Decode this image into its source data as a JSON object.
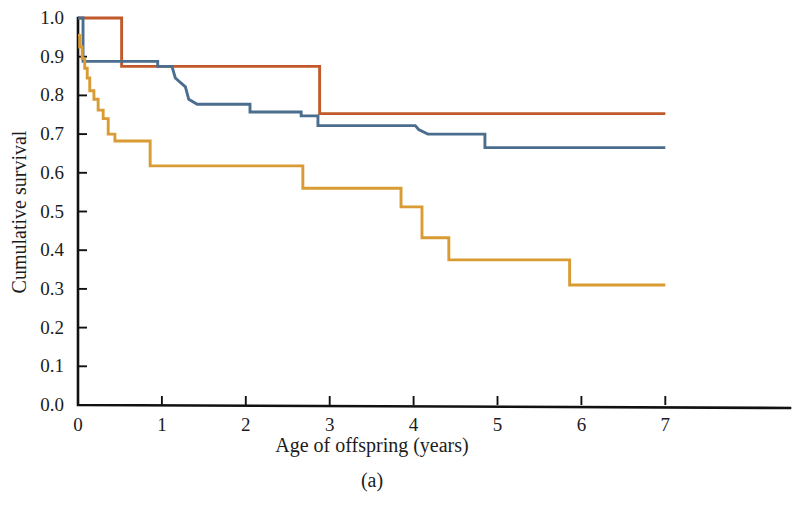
{
  "figure": {
    "panel_label": "(a)",
    "background": "#ffffff"
  },
  "chart_data": {
    "type": "line",
    "title": "",
    "subtitle": "",
    "xlabel": "Age of offspring (years)",
    "ylabel": "Cumulative survival",
    "xlim": [
      0,
      8.5
    ],
    "ylim": [
      0.0,
      1.0
    ],
    "xticks": [
      0,
      1,
      2,
      3,
      4,
      5,
      6,
      7
    ],
    "xtick_labels": [
      "0",
      "1",
      "2",
      "3",
      "4",
      "5",
      "6",
      "7"
    ],
    "yticks": [
      0.0,
      0.1,
      0.2,
      0.3,
      0.4,
      0.5,
      0.6,
      0.7,
      0.8,
      0.9,
      1.0
    ],
    "ytick_labels": [
      "0.0",
      "0.1",
      "0.2",
      "0.3",
      "0.4",
      "0.5",
      "0.6",
      "0.7",
      "0.8",
      "0.9",
      "1.0"
    ],
    "grid": false,
    "legend_position": "none",
    "step_style": "post",
    "series": [
      {
        "name": "series-orange",
        "color": "#c2592b",
        "x": [
          0.0,
          0.52,
          0.52,
          2.88,
          2.88,
          7.0
        ],
        "y": [
          1.0,
          1.0,
          0.875,
          0.875,
          0.753,
          0.753
        ]
      },
      {
        "name": "series-blue",
        "color": "#4b6e8e",
        "x": [
          0.0,
          0.06,
          0.06,
          0.95,
          0.95,
          1.12,
          1.16,
          1.28,
          1.32,
          1.42,
          1.42,
          2.05,
          2.05,
          2.66,
          2.66,
          2.86,
          2.86,
          4.02,
          4.06,
          4.17,
          4.17,
          4.85,
          4.85,
          7.0
        ],
        "y": [
          1.0,
          1.0,
          0.888,
          0.888,
          0.875,
          0.875,
          0.845,
          0.822,
          0.79,
          0.777,
          0.777,
          0.777,
          0.757,
          0.757,
          0.747,
          0.747,
          0.722,
          0.722,
          0.712,
          0.7,
          0.7,
          0.7,
          0.665,
          0.665
        ]
      },
      {
        "name": "series-yellow",
        "color": "#d99b33",
        "x": [
          0.0,
          0.02,
          0.02,
          0.05,
          0.05,
          0.08,
          0.08,
          0.11,
          0.11,
          0.14,
          0.14,
          0.19,
          0.19,
          0.24,
          0.24,
          0.3,
          0.3,
          0.36,
          0.36,
          0.44,
          0.44,
          0.86,
          0.86,
          2.68,
          2.68,
          3.85,
          3.85,
          4.1,
          4.1,
          4.42,
          4.42,
          5.86,
          5.86,
          7.0
        ],
        "y": [
          0.955,
          0.955,
          0.925,
          0.925,
          0.895,
          0.895,
          0.87,
          0.87,
          0.845,
          0.845,
          0.812,
          0.812,
          0.79,
          0.79,
          0.762,
          0.762,
          0.74,
          0.74,
          0.7,
          0.7,
          0.682,
          0.682,
          0.618,
          0.618,
          0.56,
          0.56,
          0.512,
          0.512,
          0.432,
          0.432,
          0.375,
          0.375,
          0.31,
          0.31
        ]
      }
    ]
  },
  "axes": {
    "y_axis_label": "Cumulative survival",
    "x_axis_label": "Age of offspring (years)"
  }
}
